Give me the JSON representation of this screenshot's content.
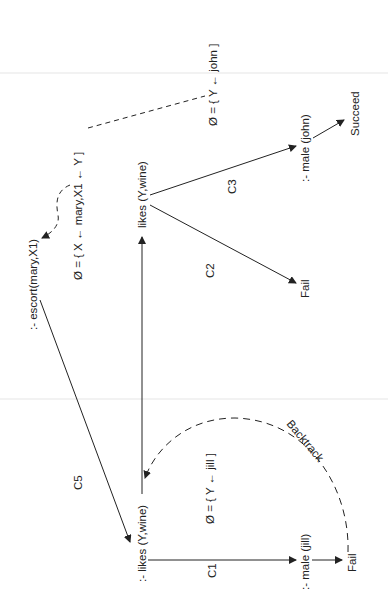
{
  "diagram": {
    "type": "prolog-search-tree",
    "orientation": "rotated-90-ccw",
    "nodes": {
      "escort": ":- escort(mary,X1)",
      "likes_top": "likes (Y,wine)",
      "likes_bottom": ":- likes (Y,wine)",
      "male_john": ":- male (john)",
      "male_jill": ":- male (jill)",
      "succeed": "Succeed",
      "fail_c2": "Fail",
      "fail_jill": "Fail"
    },
    "substitutions": {
      "top": "Ø = { X ← mary,X1 ← Y ]",
      "john": "Ø = { Y ← john ]",
      "jill": "Ø = { Y ← jill ]"
    },
    "edge_labels": {
      "c5": "C5",
      "c1": "C1",
      "c2": "C2",
      "c3": "C3",
      "backtrack": "Backtrack"
    },
    "colors": {
      "line": "#222222",
      "text": "#222222",
      "background": "#ffffff"
    }
  }
}
